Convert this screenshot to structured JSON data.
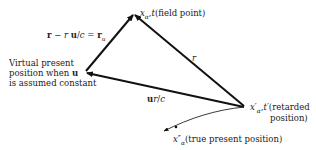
{
  "diagram": {
    "type": "vector-triangle",
    "labels": {
      "field_point": "x_α, t (field point)",
      "field_point_text": "(field point)",
      "r_minus": "r − r u/c = r_u",
      "r_label": "r",
      "virtual_present_line1": "Virtual present",
      "virtual_present_line2": "position when u",
      "virtual_present_line3": "is assumed constant",
      "ur_over_c": "ur/c",
      "retarded_line1": "(retarded",
      "retarded_line2": "position)",
      "true_present": "(true present position)"
    },
    "vertices": {
      "field_point": [
        134,
        14
      ],
      "virtual_present": [
        85,
        72
      ],
      "retarded": [
        245,
        107
      ],
      "true_present_tip": [
        162,
        131
      ]
    },
    "stroke_color": "#111111"
  }
}
